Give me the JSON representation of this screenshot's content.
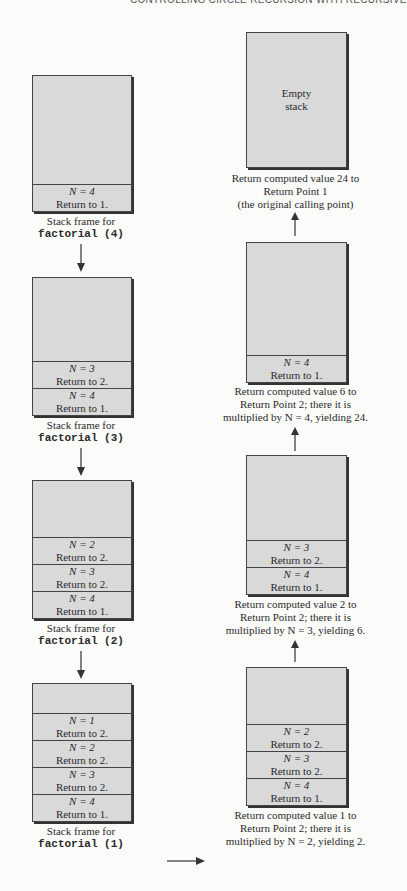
{
  "header": {
    "text": "CONTROLLING CIRCLE RECURSION WITH RECURSIVE"
  },
  "left_column": {
    "stacks": [
      {
        "frames": [
          {
            "n": "N = 4",
            "ret": "Return to 1."
          }
        ],
        "caption_line1": "Stack frame for",
        "caption_line2": "factorial (4)"
      },
      {
        "frames": [
          {
            "n": "N = 3",
            "ret": "Return to 2."
          },
          {
            "n": "N = 4",
            "ret": "Return to 1."
          }
        ],
        "caption_line1": "Stack frame for",
        "caption_line2": "factorial (3)"
      },
      {
        "frames": [
          {
            "n": "N = 2",
            "ret": "Return to 2."
          },
          {
            "n": "N = 3",
            "ret": "Return to 2."
          },
          {
            "n": "N = 4",
            "ret": "Return to 1."
          }
        ],
        "caption_line1": "Stack frame for",
        "caption_line2": "factorial (2)"
      },
      {
        "frames": [
          {
            "n": "N = 1",
            "ret": "Return to 2."
          },
          {
            "n": "N = 2",
            "ret": "Return to 2."
          },
          {
            "n": "N = 3",
            "ret": "Return to 2."
          },
          {
            "n": "N = 4",
            "ret": "Return to 1."
          }
        ],
        "caption_line1": "Stack frame for",
        "caption_line2": "factorial (1)"
      }
    ]
  },
  "right_column": {
    "stacks": [
      {
        "empty_label_line1": "Empty",
        "empty_label_line2": "stack",
        "frames": [],
        "caption_lines": [
          "Return computed value 24 to",
          "Return Point 1",
          "(the original calling point)"
        ]
      },
      {
        "frames": [
          {
            "n": "N = 4",
            "ret": "Return to 1."
          }
        ],
        "caption_lines": [
          "Return computed value 6 to",
          "Return Point 2; there it is",
          "multiplied by N = 4, yielding 24."
        ]
      },
      {
        "frames": [
          {
            "n": "N = 3",
            "ret": "Return to 2."
          },
          {
            "n": "N = 4",
            "ret": "Return to 1."
          }
        ],
        "caption_lines": [
          "Return computed value 2 to",
          "Return Point 2; there it is",
          "multiplied by N = 3, yielding 6."
        ]
      },
      {
        "frames": [
          {
            "n": "N = 2",
            "ret": "Return to 2."
          },
          {
            "n": "N = 3",
            "ret": "Return to 2."
          },
          {
            "n": "N = 4",
            "ret": "Return to 1."
          }
        ],
        "caption_lines": [
          "Return computed value 1 to",
          "Return Point 2; there it is",
          "multiplied by N = 2, yielding 2."
        ]
      }
    ]
  },
  "colors": {
    "box_fill": "#d9d9d9",
    "border": "#444444",
    "background": "#fbfbfa"
  }
}
